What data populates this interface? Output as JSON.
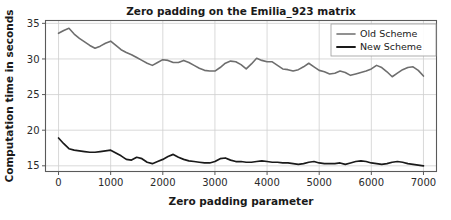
{
  "chart_data": {
    "type": "line",
    "title": "Zero padding on the Emilia_923 matrix",
    "xlabel": "Zero padding parameter",
    "ylabel": "Computation time in seconds",
    "xlim": [
      -250,
      7250
    ],
    "ylim": [
      14.2,
      35.4
    ],
    "xticks": [
      0,
      1000,
      2000,
      3000,
      4000,
      5000,
      6000,
      7000
    ],
    "xticklabels": [
      "0",
      "1000",
      "2000",
      "3000",
      "4000",
      "5000",
      "6000",
      "7000"
    ],
    "yticks": [
      15,
      20,
      25,
      30,
      35
    ],
    "yticklabels": [
      "15",
      "20",
      "25",
      "30",
      "35"
    ],
    "grid": true,
    "legend_position": "upper right",
    "x": [
      0,
      100,
      200,
      300,
      400,
      500,
      600,
      700,
      800,
      900,
      1000,
      1100,
      1200,
      1300,
      1400,
      1500,
      1600,
      1700,
      1800,
      1900,
      2000,
      2100,
      2200,
      2300,
      2400,
      2500,
      2600,
      2700,
      2800,
      2900,
      3000,
      3100,
      3200,
      3300,
      3400,
      3500,
      3600,
      3700,
      3800,
      3900,
      4000,
      4100,
      4200,
      4300,
      4400,
      4500,
      4600,
      4700,
      4800,
      4900,
      5000,
      5100,
      5200,
      5300,
      5400,
      5500,
      5600,
      5700,
      5800,
      5900,
      6000,
      6100,
      6200,
      6300,
      6400,
      6500,
      6600,
      6700,
      6800,
      6900,
      7000
    ],
    "series": [
      {
        "name": "Old Scheme",
        "color": "#6e6e6e",
        "linewidth": 1.6,
        "values": [
          33.6,
          34.0,
          34.3,
          33.5,
          32.9,
          32.4,
          31.9,
          31.5,
          31.8,
          32.2,
          32.5,
          31.9,
          31.3,
          30.9,
          30.6,
          30.2,
          29.8,
          29.4,
          29.1,
          29.5,
          29.9,
          29.8,
          29.5,
          29.5,
          29.8,
          29.5,
          29.1,
          28.7,
          28.4,
          28.3,
          28.3,
          28.8,
          29.4,
          29.7,
          29.6,
          29.2,
          28.6,
          29.3,
          30.1,
          29.8,
          29.6,
          29.6,
          29.1,
          28.6,
          28.5,
          28.3,
          28.5,
          28.9,
          29.4,
          28.9,
          28.4,
          28.2,
          27.9,
          28.0,
          28.3,
          28.1,
          27.7,
          27.9,
          28.1,
          28.3,
          28.6,
          29.1,
          28.8,
          28.2,
          27.5,
          28.0,
          28.5,
          28.8,
          28.9,
          28.4,
          27.6
        ]
      },
      {
        "name": "New Scheme",
        "color": "#1a1a1a",
        "linewidth": 1.7,
        "values": [
          18.9,
          18.1,
          17.4,
          17.2,
          17.1,
          17.0,
          16.9,
          16.9,
          17.0,
          17.1,
          17.2,
          16.8,
          16.4,
          15.9,
          15.8,
          16.2,
          16.0,
          15.5,
          15.3,
          15.6,
          15.9,
          16.3,
          16.6,
          16.2,
          15.9,
          15.7,
          15.6,
          15.5,
          15.4,
          15.4,
          15.6,
          16.0,
          16.1,
          15.8,
          15.6,
          15.6,
          15.5,
          15.5,
          15.6,
          15.7,
          15.6,
          15.5,
          15.5,
          15.4,
          15.4,
          15.3,
          15.2,
          15.3,
          15.5,
          15.6,
          15.4,
          15.3,
          15.3,
          15.3,
          15.4,
          15.2,
          15.4,
          15.6,
          15.7,
          15.6,
          15.4,
          15.3,
          15.2,
          15.3,
          15.5,
          15.6,
          15.5,
          15.3,
          15.2,
          15.1,
          15.0
        ]
      }
    ],
    "legend": [
      {
        "label": "Old Scheme",
        "color": "#6e6e6e"
      },
      {
        "label": "New Scheme",
        "color": "#1a1a1a"
      }
    ]
  }
}
